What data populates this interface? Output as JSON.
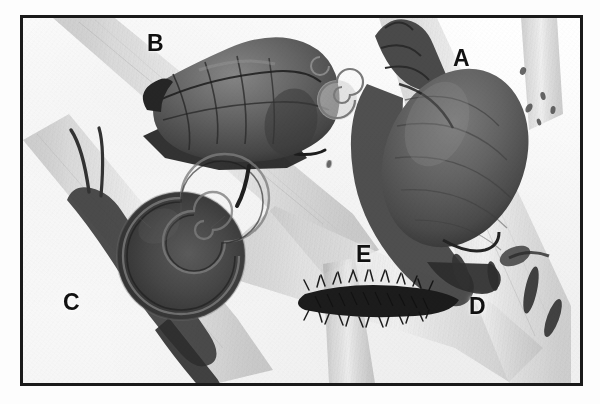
{
  "figure": {
    "kind": "scientific-plate",
    "medium": "grayscale engraving",
    "frame_color": "#1a1a1a",
    "background_color": "#fbfbfb",
    "ink_color": "#2b2b2b",
    "stem_color": "#d8d8d8"
  },
  "labels": [
    {
      "id": "A",
      "text": "A",
      "x": 450,
      "y": 44,
      "size": 23,
      "target": "large ovoid snail shell on right stem"
    },
    {
      "id": "B",
      "text": "B",
      "x": 144,
      "y": 29,
      "size": 23,
      "target": "tall conical spired snail upper left"
    },
    {
      "id": "C",
      "text": "C",
      "x": 60,
      "y": 288,
      "size": 23,
      "target": "flat discoidal coiled snail lower left"
    },
    {
      "id": "D",
      "text": "D",
      "x": 466,
      "y": 292,
      "size": 23,
      "target": "dark elongate egg capsules on stem"
    },
    {
      "id": "E",
      "text": "E",
      "x": 353,
      "y": 240,
      "size": 23,
      "target": "dark bristly caterpillar centre"
    }
  ],
  "specimens": [
    {
      "id": "A",
      "name": "large-ovoid-snail",
      "description": "large globose shell with short pointed spire, body whorl dominant, animal foot gripping stem"
    },
    {
      "id": "B",
      "name": "conical-spired-snail",
      "description": "elongate conical shell with five banded whorls, dark head and tentacles extended forward"
    },
    {
      "id": "C",
      "name": "discoidal-coiled-snail",
      "description": "flat planorbid-like disc shell, animal with two long tentacles crawling upward"
    },
    {
      "id": "D",
      "name": "egg-capsules",
      "description": "several dark elongate capsules attached to the stem surface"
    },
    {
      "id": "E",
      "name": "bristly-caterpillar",
      "description": "dark hairy elongate larva resting on a stem"
    }
  ],
  "incidentals": [
    {
      "name": "juvenile-spiral-shell",
      "description": "small pale coiled shell near top centre"
    },
    {
      "name": "speckle-cluster",
      "description": "scattered small dark specks at upper right"
    }
  ]
}
